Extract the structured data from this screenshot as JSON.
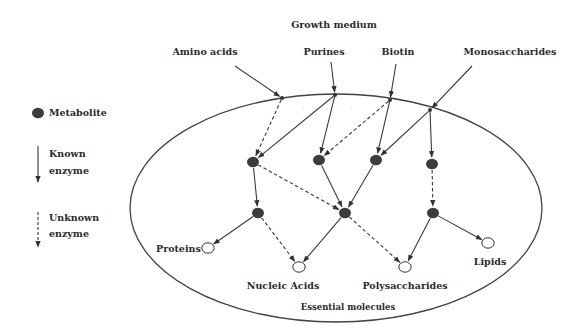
{
  "title": "Growth medium",
  "inputs": [
    {
      "label": "Amino acids",
      "x": 247,
      "y": 48
    },
    {
      "label": "Purines",
      "x": 326,
      "y": 48
    },
    {
      "label": "Biotin",
      "x": 389,
      "y": 48
    },
    {
      "label": "Monosaccharides",
      "x": 482,
      "y": 48
    }
  ],
  "legend": {
    "metabolite": "Metabolite",
    "known_line1": "Known",
    "known_line2": "enzyme",
    "unknown_line1": "Unknown",
    "unknown_line2": "enzyme"
  },
  "outputs": [
    {
      "label": "Proteins",
      "x": 155,
      "y": 243
    },
    {
      "label": "Nucleic Acids",
      "x": 283,
      "y": 286
    },
    {
      "label": "Polysaccharides",
      "x": 405,
      "y": 286
    },
    {
      "label": "Lipids",
      "x": 487,
      "y": 256
    }
  ],
  "container_label": "Essential molecules",
  "colors": {
    "line": "#3a3a3a",
    "metabolite_fill": "#3c3c3c",
    "ellipse": "#444444"
  },
  "nodes": {
    "inAmino": [
      282,
      98
    ],
    "inPurines": [
      335,
      95
    ],
    "inBiotin": [
      390,
      100
    ],
    "inMono": [
      430,
      110
    ],
    "m1": [
      253,
      162
    ],
    "m2": [
      319,
      160
    ],
    "m3": [
      376,
      160
    ],
    "m4": [
      432,
      164
    ],
    "m5": [
      258,
      213
    ],
    "m6": [
      345,
      213
    ],
    "m7": [
      433,
      213
    ],
    "proteins": [
      208,
      248
    ],
    "nucleic": [
      299,
      267
    ],
    "poly": [
      405,
      267
    ],
    "lipids": [
      488,
      243
    ]
  },
  "edges": [
    {
      "from": [
        235,
        66
      ],
      "to": "inAmino",
      "type": "known"
    },
    {
      "from": [
        331,
        62
      ],
      "to": "inPurines",
      "type": "known"
    },
    {
      "from": [
        396,
        64
      ],
      "to": "inBiotin",
      "type": "known"
    },
    {
      "from": [
        472,
        66
      ],
      "to": "inMono",
      "type": "known"
    },
    {
      "from": "inAmino",
      "to": "m1",
      "type": "unknown"
    },
    {
      "from": "inPurines",
      "to": "m1",
      "type": "known"
    },
    {
      "from": "inPurines",
      "to": "m2",
      "type": "known"
    },
    {
      "from": "inBiotin",
      "to": "m2",
      "type": "unknown"
    },
    {
      "from": "inBiotin",
      "to": "m3",
      "type": "known"
    },
    {
      "from": "inMono",
      "to": "m3",
      "type": "known"
    },
    {
      "from": "inMono",
      "to": "m4",
      "type": "known"
    },
    {
      "from": "m1",
      "to": "m5",
      "type": "known"
    },
    {
      "from": "m1",
      "to": "m6",
      "type": "unknown"
    },
    {
      "from": "m2",
      "to": "m6",
      "type": "known"
    },
    {
      "from": "m3",
      "to": "m6",
      "type": "known"
    },
    {
      "from": "m4",
      "to": "m7",
      "type": "unknown"
    },
    {
      "from": "m5",
      "to": "proteins",
      "type": "known"
    },
    {
      "from": "m5",
      "to": "nucleic",
      "type": "unknown"
    },
    {
      "from": "m6",
      "to": "nucleic",
      "type": "known"
    },
    {
      "from": "m6",
      "to": "poly",
      "type": "unknown"
    },
    {
      "from": "m7",
      "to": "poly",
      "type": "known"
    },
    {
      "from": "m7",
      "to": "lipids",
      "type": "known"
    }
  ]
}
